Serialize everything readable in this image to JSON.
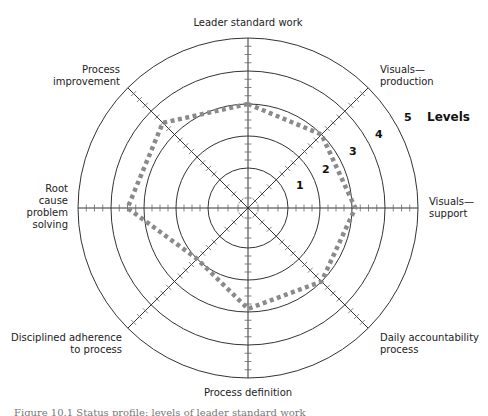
{
  "chart_data": {
    "type": "radar",
    "title": "",
    "center": [
      248,
      208
    ],
    "ring_radii": [
      40,
      72,
      104,
      137,
      170
    ],
    "levels": [
      "1",
      "2",
      "3",
      "4",
      "5"
    ],
    "levels_label": "Levels",
    "axes": [
      {
        "label": "Leader standard work",
        "angle_deg": 90
      },
      {
        "label": "Visuals—production",
        "angle_deg": 45
      },
      {
        "label": "Visuals—support",
        "angle_deg": 0
      },
      {
        "label": "Daily accountability process",
        "angle_deg": -45
      },
      {
        "label": "Process definition",
        "angle_deg": -90
      },
      {
        "label": "Disciplined adherence to process",
        "angle_deg": -135
      },
      {
        "label": "Root cause problem solving",
        "angle_deg": 180
      },
      {
        "label": "Process improvement",
        "angle_deg": 135
      }
    ],
    "series": [
      {
        "name": "Current status profile",
        "style": "dotted",
        "color": "#8a8a8a",
        "values": [
          3.0,
          3.0,
          3.1,
          3.0,
          2.9,
          2.0,
          3.5,
          3.5
        ]
      }
    ],
    "range": [
      0,
      5
    ],
    "grid": true,
    "legend_position": "none"
  },
  "labels": {
    "top": "Leader standard work",
    "ne": [
      "Visuals—",
      "production"
    ],
    "e": [
      "Visuals—",
      "support"
    ],
    "se": [
      "Daily accountability",
      "process"
    ],
    "s": "Process definition",
    "sw": [
      "Disciplined adherence",
      "to process"
    ],
    "w": [
      "Root",
      "cause",
      "problem",
      "solving"
    ],
    "nw": [
      "Process",
      "improvement"
    ]
  },
  "level_numbers": [
    "1",
    "2",
    "3",
    "4",
    "5"
  ],
  "levels_title": "Levels",
  "caption": "Figure 10.1  Status profile: levels of leader standard work"
}
